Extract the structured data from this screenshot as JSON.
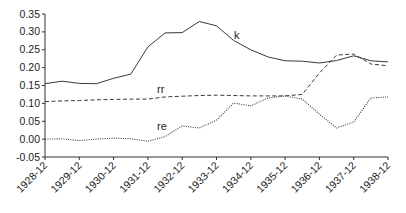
{
  "chart_data": {
    "type": "line",
    "title": "",
    "xlabel": "",
    "ylabel": "",
    "ylim": [
      -0.05,
      0.35
    ],
    "yticks": [
      "0.35",
      "0.30",
      "0.25",
      "0.20",
      "0.15",
      "0.10",
      "0.05",
      "0.00",
      "-0.05"
    ],
    "xtick_labels": [
      "1928-12",
      "1929-12",
      "1930-12",
      "1931-12",
      "1932-12",
      "1933-12",
      "1934-12",
      "1935-12",
      "1936-12",
      "1937-12",
      "1938-12"
    ],
    "x": [
      "1928-12",
      "1929-06",
      "1929-12",
      "1930-06",
      "1930-12",
      "1931-06",
      "1931-12",
      "1932-06",
      "1932-12",
      "1933-06",
      "1933-12",
      "1934-06",
      "1934-12",
      "1935-06",
      "1935-12",
      "1936-06",
      "1936-12",
      "1937-06",
      "1937-12",
      "1938-06",
      "1938-12"
    ],
    "grid": false,
    "legend": "inline labels",
    "series": [
      {
        "name": "k",
        "style": "solid",
        "values": [
          0.155,
          0.162,
          0.156,
          0.155,
          0.17,
          0.182,
          0.258,
          0.297,
          0.298,
          0.329,
          0.317,
          0.276,
          0.25,
          0.23,
          0.219,
          0.218,
          0.213,
          0.22,
          0.233,
          0.219,
          0.216
        ]
      },
      {
        "name": "rr",
        "style": "dashed",
        "values": [
          0.105,
          0.107,
          0.108,
          0.11,
          0.111,
          0.112,
          0.112,
          0.118,
          0.12,
          0.122,
          0.123,
          0.122,
          0.121,
          0.121,
          0.121,
          0.125,
          0.185,
          0.235,
          0.238,
          0.21,
          0.205
        ]
      },
      {
        "name": "re",
        "style": "dotted",
        "values": [
          0.0,
          0.001,
          -0.004,
          0.0,
          0.003,
          0.001,
          -0.006,
          0.007,
          0.037,
          0.031,
          0.053,
          0.101,
          0.093,
          0.115,
          0.121,
          0.112,
          0.07,
          0.031,
          0.048,
          0.115,
          0.118
        ]
      }
    ],
    "annotations": [
      {
        "text": "k",
        "series": "k"
      },
      {
        "text": "rr",
        "series": "rr"
      },
      {
        "text": "re",
        "series": "re"
      }
    ]
  },
  "colors": {
    "line": "#3a3a3a",
    "axis": "#333333",
    "text": "#222222",
    "background": "#ffffff"
  }
}
